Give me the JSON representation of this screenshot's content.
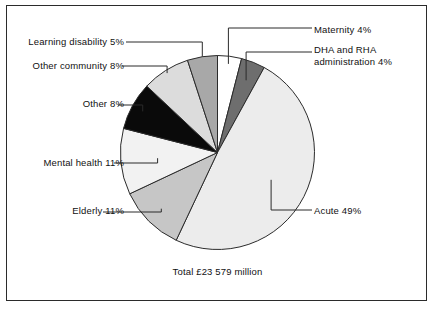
{
  "chart_data": {
    "type": "pie",
    "title": "",
    "subtitle": "",
    "total_caption": "Total  £23 579 million",
    "legend_position": "callout-labels",
    "grid": false,
    "units": "percent",
    "categories": [
      "Maternity",
      "DHA and RHA administration",
      "Acute",
      "Elderly",
      "Mental health",
      "Other",
      "Other community",
      "Learning disability"
    ],
    "values": [
      4,
      4,
      49,
      11,
      11,
      8,
      8,
      5
    ],
    "slices": [
      {
        "label": "Maternity",
        "percent": 4,
        "value_text": "4%",
        "label_text": "Maternity  4%",
        "color": "#ffffff",
        "start_deg": 0,
        "end_deg": 14.4
      },
      {
        "label": "DHA and RHA administration",
        "percent": 4,
        "value_text": "4%",
        "label_text": "DHA and RHA",
        "label_text_line2": "administration  4%",
        "color": "#6e6e6e",
        "start_deg": 14.4,
        "end_deg": 28.8
      },
      {
        "label": "Acute",
        "percent": 49,
        "value_text": "49%",
        "label_text": "Acute  49%",
        "color": "#ececec",
        "start_deg": 28.8,
        "end_deg": 205.2
      },
      {
        "label": "Elderly",
        "percent": 11,
        "value_text": "11%",
        "label_text": "Elderly  11%",
        "color": "#c6c6c6",
        "start_deg": 205.2,
        "end_deg": 244.8
      },
      {
        "label": "Mental health",
        "percent": 11,
        "value_text": "11%",
        "label_text": "Mental health  11%",
        "color": "#f2f2f2",
        "start_deg": 244.8,
        "end_deg": 284.4
      },
      {
        "label": "Other",
        "percent": 8,
        "value_text": "8%",
        "label_text": "Other  8%",
        "color": "#0a0a0a",
        "start_deg": 284.4,
        "end_deg": 313.2
      },
      {
        "label": "Other community",
        "percent": 8,
        "value_text": "8%",
        "label_text": "Other community  8%",
        "color": "#dcdcdc",
        "start_deg": 313.2,
        "end_deg": 342.0
      },
      {
        "label": "Learning disability",
        "percent": 5,
        "value_text": "5%",
        "label_text": "Learning disability  5%",
        "color": "#a8a8a8",
        "start_deg": 342.0,
        "end_deg": 360
      }
    ],
    "colors": {
      "outline": "#2b2b2b",
      "text": "#111111",
      "background": "#ffffff",
      "frame": "#2b2b2b"
    }
  },
  "labels": {
    "maternity": "Maternity  4%",
    "dha_line1": "DHA and RHA",
    "dha_line2": "administration  4%",
    "acute": "Acute  49%",
    "elderly": "Elderly  11%",
    "mental_health": "Mental health  11%",
    "other": "Other  8%",
    "other_community": "Other community  8%",
    "learning_disability": "Learning disability  5%",
    "total": "Total  £23 579 million"
  }
}
